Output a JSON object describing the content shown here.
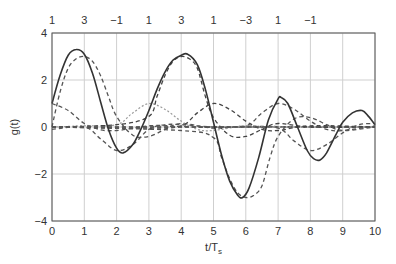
{
  "chart_data": {
    "type": "line",
    "title": "",
    "xlabel": "t/T",
    "xlabel_subscript": "s",
    "ylabel": "g(t)",
    "xlim": [
      0,
      10
    ],
    "ylim": [
      -4,
      4
    ],
    "grid": true,
    "legend": null,
    "x_ticks": [
      "0",
      "1",
      "2",
      "3",
      "4",
      "5",
      "6",
      "7",
      "8",
      "9",
      "10"
    ],
    "y_ticks": [
      "4",
      "2",
      "0",
      "−2",
      "−4"
    ],
    "y_tick_values": [
      4,
      2,
      0,
      -2,
      -4
    ],
    "top_axis": {
      "positions": [
        0,
        1,
        2,
        3,
        4,
        5,
        6,
        7,
        8
      ],
      "labels": [
        "1",
        "3",
        "−1",
        "1",
        "3",
        "1",
        "−3",
        "1",
        "−1"
      ]
    },
    "symbols": [
      1,
      3,
      -1,
      1,
      3,
      1,
      -3,
      1,
      -1
    ],
    "series": [
      {
        "name": "sum g(t)",
        "style": "solid",
        "color": "#333333",
        "x": [
          0,
          0.25,
          0.5,
          0.75,
          1.0,
          1.25,
          1.5,
          1.75,
          2.0,
          2.2,
          2.5,
          2.75,
          3.0,
          3.25,
          3.5,
          3.75,
          4.0,
          4.2,
          4.5,
          4.75,
          5.0,
          5.25,
          5.5,
          5.75,
          5.9,
          6.1,
          6.4,
          6.7,
          7.0,
          7.1,
          7.3,
          7.6,
          7.9,
          8.1,
          8.3,
          8.5,
          8.8,
          9.0,
          9.3,
          9.6,
          9.8,
          10.0
        ],
        "values": [
          1.0,
          2.2,
          3.05,
          3.3,
          3.1,
          2.3,
          1.1,
          -0.1,
          -0.9,
          -1.1,
          -0.75,
          -0.1,
          0.7,
          1.6,
          2.35,
          2.85,
          3.05,
          3.1,
          2.65,
          1.6,
          0.2,
          -1.2,
          -2.3,
          -2.9,
          -3.0,
          -2.6,
          -1.3,
          0.3,
          1.2,
          1.25,
          1.0,
          0.0,
          -1.0,
          -1.35,
          -1.4,
          -1.1,
          -0.3,
          0.2,
          0.6,
          0.7,
          0.45,
          0.1
        ]
      },
      {
        "name": "pulse a0=1 (t=0)",
        "style": "dashed",
        "color": "#555555",
        "x": [
          0,
          0.5,
          1.0,
          1.5,
          2.0,
          2.5,
          3.0,
          3.5,
          4.0,
          5.0,
          6.0,
          8.0,
          10.0
        ],
        "values": [
          1.0,
          0.7,
          0.15,
          -0.12,
          -0.15,
          -0.05,
          0.05,
          0.06,
          0.02,
          -0.02,
          0.01,
          0.0,
          0.0
        ]
      },
      {
        "name": "pulse a1=3 (t=1)",
        "style": "dashed",
        "color": "#555555",
        "x": [
          0,
          0.25,
          0.5,
          0.75,
          1.0,
          1.25,
          1.5,
          1.75,
          2.0,
          2.5,
          3.0,
          3.5,
          4.0,
          5.0,
          6.0,
          8.0,
          10.0
        ],
        "values": [
          0.0,
          1.5,
          2.5,
          2.9,
          3.0,
          2.8,
          2.2,
          1.3,
          0.45,
          -0.35,
          -0.4,
          -0.1,
          0.15,
          -0.05,
          0.03,
          0.0,
          0.0
        ]
      },
      {
        "name": "pulse a2=-1 (t=2)",
        "style": "dashed",
        "color": "#555555",
        "x": [
          0,
          1.0,
          1.5,
          2.0,
          2.5,
          3.0,
          3.5,
          4.0,
          5.0,
          6.0,
          10.0
        ],
        "values": [
          -0.1,
          0.0,
          -0.5,
          -1.0,
          -0.75,
          -0.1,
          0.1,
          0.1,
          0.0,
          0.0,
          0.0
        ]
      },
      {
        "name": "pulse a3=1 (t=3)",
        "style": "dotted",
        "color": "#9a9a9a",
        "x": [
          0,
          1.0,
          2.0,
          2.5,
          3.0,
          3.5,
          4.0,
          4.5,
          5.0,
          6.0,
          7.0,
          10.0
        ],
        "values": [
          0.0,
          0.05,
          0.1,
          0.6,
          1.0,
          0.75,
          0.25,
          -0.1,
          -0.15,
          0.05,
          0.0,
          0.0
        ]
      },
      {
        "name": "pulse a4=3 (t=4)",
        "style": "dashed",
        "color": "#444444",
        "x": [
          0,
          2.0,
          3.0,
          3.25,
          3.5,
          3.75,
          4.0,
          4.25,
          4.5,
          4.75,
          5.0,
          5.5,
          6.0,
          6.5,
          7.0,
          8.0,
          10.0
        ],
        "values": [
          0.0,
          0.1,
          0.45,
          1.3,
          2.2,
          2.8,
          3.0,
          2.9,
          2.5,
          1.3,
          0.4,
          -0.35,
          -0.4,
          -0.1,
          0.15,
          0.0,
          0.0
        ]
      },
      {
        "name": "pulse a5=1 (t=5)",
        "style": "dashed",
        "color": "#444444",
        "x": [
          0,
          3.0,
          4.0,
          4.5,
          5.0,
          5.5,
          6.0,
          6.5,
          7.0,
          8.0,
          10.0
        ],
        "values": [
          0.0,
          -0.05,
          0.05,
          0.6,
          1.0,
          0.75,
          0.25,
          -0.1,
          -0.15,
          0.05,
          0.0
        ]
      },
      {
        "name": "pulse a6=-3 (t=6)",
        "style": "dashed",
        "color": "#555555",
        "x": [
          0,
          4.0,
          5.0,
          5.25,
          5.5,
          5.75,
          6.0,
          6.25,
          6.5,
          6.75,
          7.0,
          7.5,
          8.0,
          8.5,
          9.0,
          10.0
        ],
        "values": [
          0.0,
          -0.15,
          -0.45,
          -1.3,
          -2.2,
          -2.8,
          -3.0,
          -2.9,
          -2.5,
          -1.3,
          -0.4,
          0.35,
          0.4,
          0.1,
          -0.15,
          0.0
        ]
      },
      {
        "name": "pulse a7=1 (t=7)",
        "style": "dashed",
        "color": "#555555",
        "x": [
          0,
          5.0,
          6.0,
          6.5,
          7.0,
          7.5,
          8.0,
          8.5,
          9.0,
          10.0
        ],
        "values": [
          0.0,
          0.0,
          0.05,
          0.6,
          1.0,
          0.75,
          0.25,
          -0.1,
          -0.15,
          0.05
        ]
      },
      {
        "name": "pulse a8=-1 (t=8)",
        "style": "dashed",
        "color": "#555555",
        "x": [
          0,
          6.0,
          7.0,
          7.5,
          8.0,
          8.5,
          9.0,
          9.5,
          10.0
        ],
        "values": [
          0.0,
          0.0,
          -0.05,
          -0.6,
          -1.0,
          -0.75,
          -0.25,
          0.1,
          0.15
        ]
      }
    ]
  },
  "layout": {
    "plot_left": 52,
    "plot_right": 375,
    "plot_top": 33,
    "plot_bottom": 221
  }
}
